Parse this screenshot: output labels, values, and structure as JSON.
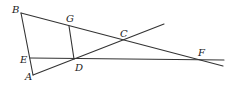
{
  "diagram": {
    "type": "geometry-figure",
    "points": {
      "A": {
        "label": "A",
        "x": 33,
        "y": 75
      },
      "B": {
        "label": "B",
        "x": 21,
        "y": 13
      },
      "C": {
        "label": "C",
        "x": 125,
        "y": 40
      },
      "D": {
        "label": "D",
        "x": 74,
        "y": 59
      },
      "E": {
        "label": "E",
        "x": 30,
        "y": 58
      },
      "F": {
        "label": "F",
        "x": 199,
        "y": 60
      },
      "G": {
        "label": "G",
        "x": 69,
        "y": 26
      }
    },
    "segments": [
      {
        "name": "AB",
        "from": "A",
        "to": "B"
      },
      {
        "name": "B-C-F ray",
        "from": "B",
        "to": "end_BF"
      },
      {
        "name": "A-D-C ray",
        "from": "A",
        "to": "end_AC"
      },
      {
        "name": "E-D-F ray",
        "from": "E",
        "to": "end_EF"
      },
      {
        "name": "GD",
        "from": "G",
        "to": "D"
      }
    ],
    "colors": {
      "line": "#333333",
      "background": "#ffffff"
    }
  }
}
